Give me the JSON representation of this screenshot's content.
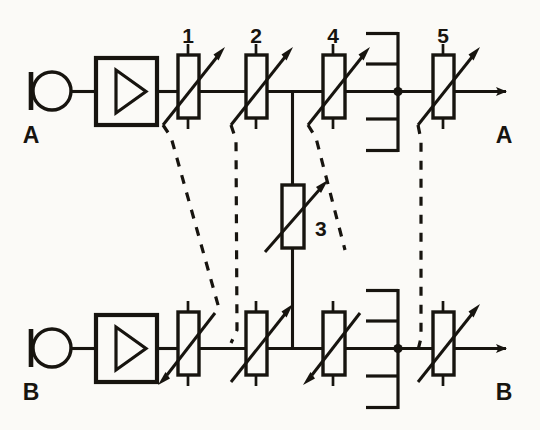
{
  "diagram": {
    "type": "electrical-schematic",
    "background_color": "#fbfaf7",
    "ink_color": "#17140f"
  },
  "ports": {
    "channel_a_input": "A",
    "channel_a_output": "A",
    "channel_b_input": "B",
    "channel_b_output": "B"
  },
  "component_labels": {
    "r1": "1",
    "r2": "2",
    "r3": "3",
    "r4": "4",
    "r5": "5"
  },
  "channels": [
    {
      "name": "A",
      "row": "top",
      "input_label": "A",
      "output_label": "A",
      "source_symbol": "terminal-circle",
      "amplifier_symbol": "triangle-amplifier",
      "attenuators": [
        {
          "label": "1",
          "arrow_direction": "up-right"
        },
        {
          "label": "2",
          "arrow_direction": "up-right"
        },
        {
          "label": "4",
          "arrow_direction": "up-right"
        },
        {
          "label": "5",
          "arrow_direction": "up-right"
        }
      ],
      "bracket": "comb-left-4-stub"
    },
    {
      "name": "B",
      "row": "bottom",
      "input_label": "B",
      "output_label": "B",
      "source_symbol": "terminal-circle",
      "amplifier_symbol": "triangle-amplifier",
      "attenuators": [
        {
          "label": "",
          "arrow_direction": "down-left"
        },
        {
          "label": "",
          "arrow_direction": "up-right"
        },
        {
          "label": "",
          "arrow_direction": "down-left"
        },
        {
          "label": "",
          "arrow_direction": "up-right"
        }
      ],
      "bracket": "comb-left-4-stub"
    }
  ],
  "shared_component": {
    "label": "3",
    "orientation": "vertical",
    "arrow_direction": "up-right",
    "description": "series-bridging-variable-resistor"
  },
  "ganged_links": [
    {
      "from": "1",
      "to": "B-stage-1",
      "style": "dashed"
    },
    {
      "from": "2",
      "to": "B-stage-2",
      "style": "dashed"
    },
    {
      "from": "4",
      "to": "3",
      "style": "dashed"
    },
    {
      "from": "5",
      "to": "B-stage-5",
      "style": "dashed"
    }
  ]
}
